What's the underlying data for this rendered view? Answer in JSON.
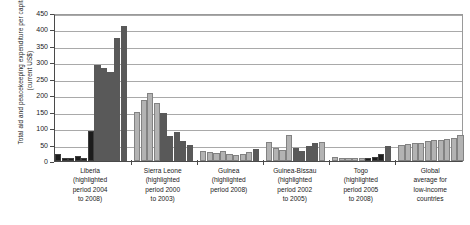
{
  "chart_data": {
    "type": "bar",
    "title": "",
    "xlabel": "",
    "ylabel": "Total aid and peacekeeping expenditure per capita (current US$)",
    "ylim": [
      0,
      450
    ],
    "ytick_labels": [
      "0",
      "50",
      "100",
      "150",
      "200",
      "250",
      "300",
      "350",
      "400",
      "450"
    ],
    "ytick_values": [
      0,
      50,
      100,
      150,
      200,
      250,
      300,
      350,
      400,
      450
    ],
    "grid": true,
    "legend": "none",
    "colors": {
      "highlighted": "#595959",
      "normal": "#b3b3b3",
      "dark_early": "#1c1c1c",
      "axis": "#4a4a4a",
      "grid": "#a9a9a9"
    },
    "groups": [
      {
        "name": "Liberia",
        "caption": [
          "Liberia",
          "(highlighted",
          "period 2004",
          "to 2008)"
        ],
        "values": [
          22,
          10,
          9,
          16,
          10,
          90,
          293,
          283,
          272,
          375,
          412
        ],
        "shades": [
          "dark_early",
          "dark_early",
          "dark_early",
          "dark_early",
          "dark_early",
          "dark_early",
          "highlighted",
          "highlighted",
          "highlighted",
          "highlighted",
          "highlighted"
        ]
      },
      {
        "name": "Sierra Leone",
        "caption": [
          "Sierra Leone",
          "(highlighted",
          "period 2000",
          "to 2003)"
        ],
        "values": [
          150,
          185,
          207,
          175,
          145,
          75,
          88,
          62,
          50
        ],
        "shades": [
          "normal",
          "normal",
          "normal",
          "normal",
          "highlighted",
          "highlighted",
          "highlighted",
          "highlighted",
          "highlighted"
        ]
      },
      {
        "name": "Guinea",
        "caption": [
          "Guinea",
          "(highlighted",
          "period 2008)"
        ],
        "values": [
          30,
          26,
          24,
          29,
          22,
          19,
          22,
          26,
          36
        ],
        "shades": [
          "normal",
          "normal",
          "normal",
          "normal",
          "normal",
          "normal",
          "normal",
          "normal",
          "highlighted"
        ]
      },
      {
        "name": "Guinea-Bissau",
        "caption": [
          "Guinea-Bissau",
          "(highlighted",
          "period 2002",
          "to 2005)"
        ],
        "values": [
          58,
          40,
          34,
          80,
          40,
          30,
          47,
          55,
          57
        ],
        "shades": [
          "normal",
          "normal",
          "normal",
          "normal",
          "highlighted",
          "highlighted",
          "highlighted",
          "highlighted",
          "normal"
        ]
      },
      {
        "name": "Togo",
        "caption": [
          "Togo",
          "(highlighted",
          "period 2005",
          "to 2008)"
        ],
        "values": [
          11,
          10,
          9,
          9,
          8,
          9,
          13,
          22,
          47
        ],
        "shades": [
          "normal",
          "normal",
          "normal",
          "normal",
          "normal",
          "dark_early",
          "dark_early",
          "dark_early",
          "highlighted"
        ]
      },
      {
        "name": "Global average for low-income countries",
        "caption": [
          "Global",
          "average for",
          "low-income",
          "countries"
        ],
        "values": [
          48,
          52,
          55,
          54,
          62,
          63,
          64,
          66,
          70,
          80
        ],
        "shades": [
          "normal",
          "normal",
          "normal",
          "normal",
          "normal",
          "normal",
          "normal",
          "normal",
          "normal",
          "normal"
        ]
      }
    ]
  }
}
